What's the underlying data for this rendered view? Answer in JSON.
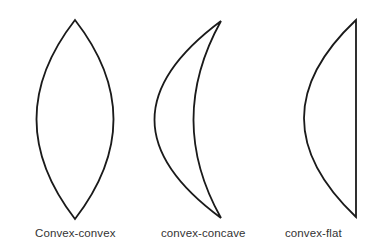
{
  "diagram": {
    "lenses": [
      {
        "id": "convex-convex",
        "label": "Convex-convex"
      },
      {
        "id": "convex-concave",
        "label": "convex-concave"
      },
      {
        "id": "convex-flat",
        "label": "convex-flat"
      }
    ],
    "stroke_color": "#1a1a1a",
    "background": "#ffffff"
  }
}
